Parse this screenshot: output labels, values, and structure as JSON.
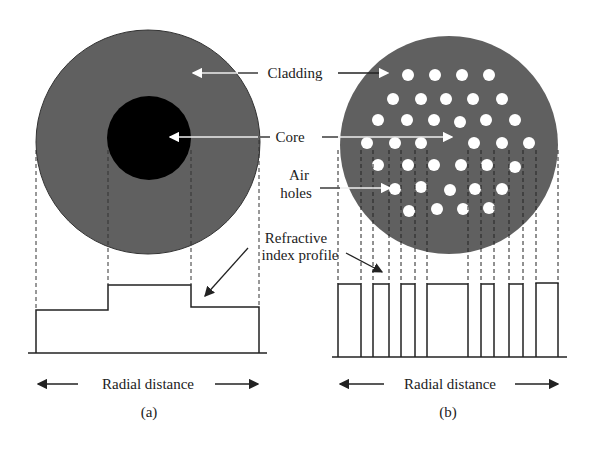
{
  "labels": {
    "cladding": "Cladding",
    "core": "Core",
    "air_holes_line1": "Air",
    "air_holes_line2": "holes",
    "refractive_line1": "Refractive",
    "refractive_line2": "index profile",
    "radial_distance_a": "Radial distance",
    "radial_distance_b": "Radial distance",
    "panel_a": "(a)",
    "panel_b": "(b)"
  },
  "colors": {
    "cladding": "#606060",
    "core": "#000000",
    "air_hole": "#ffffff",
    "line": "#222222"
  }
}
